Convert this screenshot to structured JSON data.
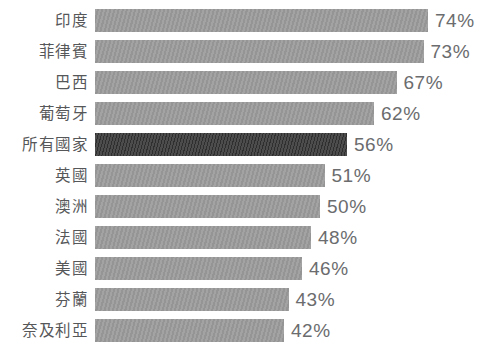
{
  "chart_data": {
    "type": "bar",
    "orientation": "horizontal",
    "title": "",
    "xlabel": "",
    "ylabel": "",
    "value_suffix": "%",
    "xlim": [
      0,
      74
    ],
    "grid": false,
    "legend": "none",
    "categories": [
      "印度",
      "菲律賓",
      "巴西",
      "葡萄牙",
      "所有國家",
      "英國",
      "澳洲",
      "法國",
      "美國",
      "芬蘭",
      "奈及利亞"
    ],
    "values": [
      74,
      73,
      67,
      62,
      56,
      51,
      50,
      48,
      46,
      43,
      42
    ],
    "value_labels": [
      "74%",
      "73%",
      "67%",
      "62%",
      "56%",
      "51%",
      "50%",
      "48%",
      "46%",
      "43%",
      "42%"
    ],
    "highlight_index": 4,
    "colors": {
      "bar": "#9d9d9d",
      "highlight_bar": "#434343",
      "label_text": "#565759",
      "value_text": "#6b6c6e",
      "background": "#ffffff"
    }
  }
}
